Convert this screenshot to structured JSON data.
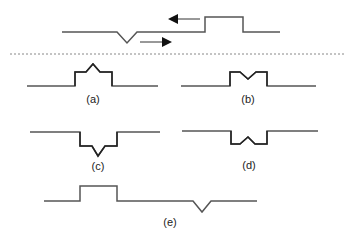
{
  "diagram": {
    "top": {
      "description": "Wave propagation: rectangular pulse moving left, triangular dip moving right",
      "arrow_left": "left-arrow",
      "arrow_right": "right-arrow"
    },
    "divider": "dotted-line",
    "panels": [
      {
        "label": "(a)",
        "shape": "pulse-with-peak-up"
      },
      {
        "label": "(b)",
        "shape": "pulse-with-notch-down"
      },
      {
        "label": "(c)",
        "shape": "inverted-pulse-with-peak-down"
      },
      {
        "label": "(d)",
        "shape": "inverted-pulse-with-notch-up"
      },
      {
        "label": "(e)",
        "shape": "separated-pulse-and-dip"
      }
    ],
    "colors": {
      "line": "#555555",
      "stroke_dark": "#222222",
      "divider": "#888888"
    }
  }
}
